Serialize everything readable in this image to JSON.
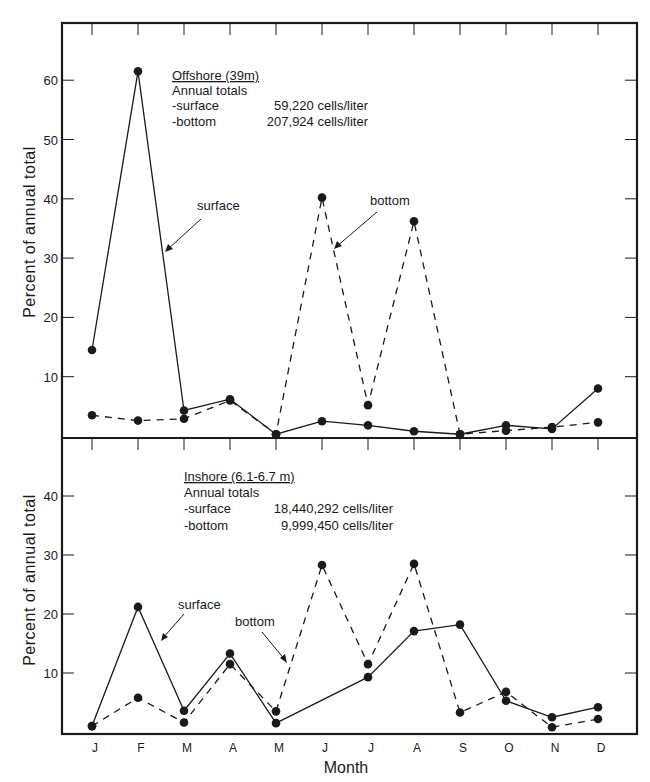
{
  "figure": {
    "ylabel": "Percent of annual total",
    "xlabel": "Month",
    "months": [
      "J",
      "F",
      "M",
      "A",
      "M",
      "J",
      "J",
      "A",
      "S",
      "O",
      "N",
      "D"
    ]
  },
  "panels": [
    {
      "id": "offshore",
      "title": "Offshore (39m)",
      "totals_heading": "Annual totals",
      "totals": [
        {
          "label": "-surface",
          "value": "59,220 cells/liter"
        },
        {
          "label": "-bottom",
          "value": "207,924 cells/liter"
        }
      ],
      "yticks": [
        10,
        20,
        30,
        40,
        50,
        60
      ],
      "annotations": {
        "surface": "surface",
        "bottom": "bottom"
      }
    },
    {
      "id": "inshore",
      "title": "Inshore (6.1-6.7 m)",
      "totals_heading": "Annual totals",
      "totals": [
        {
          "label": "-surface",
          "value": "18,440,292 cells/liter"
        },
        {
          "label": "-bottom",
          "value": "9,999,450 cells/liter"
        }
      ],
      "yticks": [
        10,
        20,
        30,
        40
      ],
      "annotations": {
        "surface": "surface",
        "bottom": "bottom"
      }
    }
  ],
  "chart_data": [
    {
      "type": "line",
      "title": "Offshore (39m)",
      "xlabel": "Month",
      "ylabel": "Percent of annual total",
      "categories": [
        "J",
        "F",
        "M",
        "A",
        "M",
        "J",
        "J",
        "A",
        "S",
        "O",
        "N",
        "D"
      ],
      "ylim": [
        0,
        65
      ],
      "grid": false,
      "series": [
        {
          "name": "surface",
          "style": "solid",
          "values": [
            14.5,
            61.5,
            4.3,
            6.2,
            0.3,
            2.5,
            1.8,
            0.8,
            0.3,
            1.8,
            1.2,
            8.0
          ]
        },
        {
          "name": "bottom",
          "style": "dashed",
          "values": [
            3.5,
            2.6,
            2.9,
            6.0,
            0.3,
            40.2,
            5.2,
            36.2,
            0.3,
            0.9,
            1.5,
            2.3
          ]
        }
      ],
      "annual_totals": {
        "surface": "59,220 cells/liter",
        "bottom": "207,924 cells/liter"
      }
    },
    {
      "type": "line",
      "title": "Inshore (6.1-6.7 m)",
      "xlabel": "Month",
      "ylabel": "Percent of annual total",
      "categories": [
        "J",
        "F",
        "M",
        "A",
        "M",
        "J",
        "J",
        "A",
        "S",
        "O",
        "N",
        "D"
      ],
      "ylim": [
        0,
        50
      ],
      "grid": false,
      "series": [
        {
          "name": "surface",
          "style": "solid",
          "values": [
            1.0,
            21.2,
            3.6,
            13.3,
            1.5,
            null,
            9.3,
            17.1,
            18.2,
            5.3,
            2.5,
            4.2
          ]
        },
        {
          "name": "bottom",
          "style": "dashed",
          "values": [
            1.0,
            5.8,
            1.6,
            11.5,
            3.5,
            28.3,
            11.5,
            28.5,
            3.3,
            6.8,
            0.8,
            2.2
          ]
        }
      ],
      "annual_totals": {
        "surface": "18,440,292 cells/liter",
        "bottom": "9,999,450 cells/liter"
      }
    }
  ]
}
